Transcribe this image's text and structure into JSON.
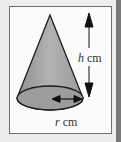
{
  "diagram": {
    "shape": "right circular cone",
    "labels": {
      "height_var": "h",
      "height_unit": "cm",
      "radius_var": "r",
      "radius_unit": "cm"
    },
    "colors": {
      "cone_fill": "#a9a9a9",
      "base_fill": "#9c9c9c",
      "stroke": "#1a1a1a",
      "frame_border": "#6e6e6e",
      "background": "#ededed"
    }
  }
}
